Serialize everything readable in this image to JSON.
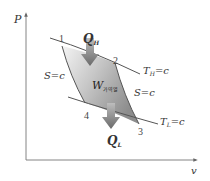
{
  "diagram": {
    "axes": {
      "y_label": "P",
      "x_label": "v"
    },
    "points": [
      {
        "id": "1",
        "label": "1"
      },
      {
        "id": "2",
        "label": "2"
      },
      {
        "id": "3",
        "label": "3"
      },
      {
        "id": "4",
        "label": "4"
      }
    ],
    "curves": {
      "isotherm_high": {
        "T": "T",
        "sub": "H",
        "rest": "=c"
      },
      "isotherm_low": {
        "T": "T",
        "sub": "L",
        "rest": "=c"
      },
      "isentrope_left": "S=c",
      "isentrope_right": "S=c"
    },
    "heat_in": {
      "Q": "Q",
      "sub": "H"
    },
    "heat_out": {
      "Q": "Q",
      "sub": "L"
    },
    "work": {
      "W": "W",
      "sub": "가역열"
    },
    "colors": {
      "line": "#555555",
      "axis": "#666666",
      "fill_light": "#f2f2f2",
      "fill_dark": "#9a9a9a",
      "arrow": "#7a7a7a"
    }
  }
}
